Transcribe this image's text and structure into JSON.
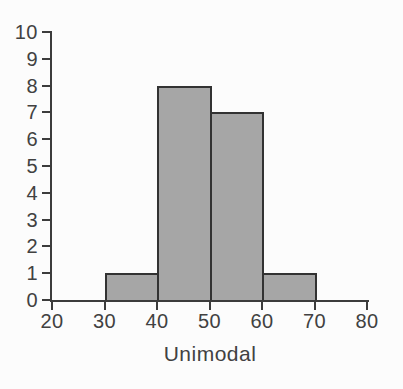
{
  "figure": {
    "background": "#fcfcfc"
  },
  "chart_data": {
    "type": "bar",
    "subtype": "histogram",
    "title": "",
    "xlabel": "Unimodal",
    "ylabel": "",
    "bin_edges": [
      30,
      40,
      50,
      60,
      70
    ],
    "values": [
      1,
      8,
      7,
      1
    ],
    "xlim": [
      20,
      80
    ],
    "ylim": [
      0,
      10
    ],
    "x_ticks": [
      20,
      30,
      40,
      50,
      60,
      70,
      80
    ],
    "y_ticks": [
      0,
      1,
      2,
      3,
      4,
      5,
      6,
      7,
      8,
      9,
      10
    ],
    "grid": false,
    "legend": false,
    "bar_fill": "#a6a6a6",
    "bar_border": "#323232",
    "axis_color": "#3c3c3c",
    "text_color": "#414141"
  }
}
